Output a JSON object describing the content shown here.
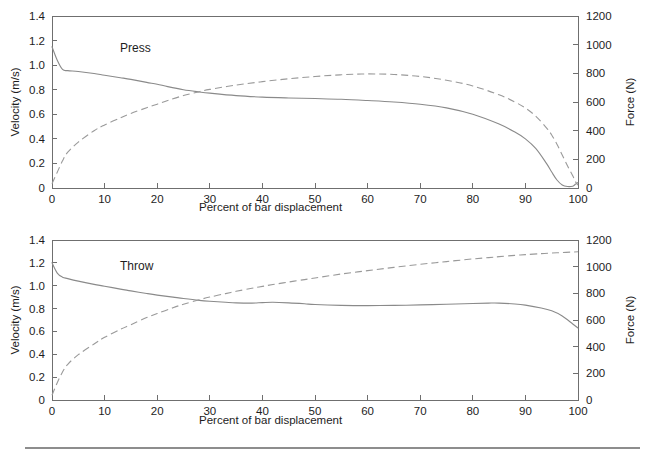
{
  "figure": {
    "background_color": "#ffffff",
    "line_color_solid": "#8a8a8a",
    "line_color_dashed": "#9a9a9a",
    "axis_color": "#6f6f6f",
    "footer_rule": true
  },
  "chart_data": [
    {
      "type": "line",
      "title": "Press",
      "panel": "top",
      "xlabel": "Percent of bar displacement",
      "ylabel": "Velocity (m/s)",
      "y2label": "Force (N)",
      "xlim": [
        0,
        100
      ],
      "ylim": [
        0,
        1.4
      ],
      "y2lim": [
        0,
        1200
      ],
      "xticks": [
        0,
        10,
        20,
        30,
        40,
        50,
        60,
        70,
        80,
        90,
        100
      ],
      "yticks": [
        0,
        0.2,
        0.4,
        0.6,
        0.8,
        1.0,
        1.2,
        1.4
      ],
      "y2ticks": [
        0,
        200,
        400,
        600,
        800,
        1000,
        1200
      ],
      "xticklabels": [
        "0",
        "10",
        "20",
        "30",
        "40",
        "50",
        "60",
        "70",
        "80",
        "90",
        "100"
      ],
      "yticklabels": [
        "0",
        "0.2",
        "0.4",
        "0.6",
        "0.8",
        "1.0",
        "1.2",
        "1.4"
      ],
      "y2ticklabels": [
        "0",
        "200",
        "400",
        "600",
        "800",
        "1000",
        "1200"
      ],
      "grid": false,
      "legend": null,
      "x": [
        0,
        1,
        2,
        3,
        5,
        8,
        10,
        13,
        15,
        18,
        20,
        22,
        25,
        28,
        30,
        35,
        40,
        45,
        50,
        55,
        60,
        65,
        70,
        75,
        80,
        85,
        88,
        90,
        92,
        94,
        95,
        96,
        97,
        98,
        99,
        99.5,
        100
      ],
      "series": [
        {
          "name": "Velocity (m/s)",
          "axis": "left",
          "style": "solid",
          "values": [
            1.15,
            1.04,
            0.965,
            0.955,
            0.948,
            0.932,
            0.918,
            0.898,
            0.884,
            0.86,
            0.845,
            0.825,
            0.8,
            0.782,
            0.772,
            0.752,
            0.74,
            0.733,
            0.728,
            0.722,
            0.712,
            0.7,
            0.682,
            0.652,
            0.6,
            0.52,
            0.455,
            0.4,
            0.32,
            0.2,
            0.13,
            0.065,
            0.025,
            0.012,
            0.015,
            0.03,
            0.045
          ]
        },
        {
          "name": "Force (N)",
          "axis": "right",
          "style": "dashed",
          "values": [
            30,
            110,
            190,
            250,
            320,
            400,
            440,
            490,
            520,
            560,
            585,
            610,
            645,
            672,
            688,
            718,
            742,
            762,
            778,
            790,
            796,
            792,
            778,
            752,
            712,
            650,
            600,
            558,
            500,
            420,
            370,
            305,
            230,
            155,
            85,
            45,
            20
          ]
        }
      ]
    },
    {
      "type": "line",
      "title": "Throw",
      "panel": "bottom",
      "xlabel": "Percent of bar displacement",
      "ylabel": "Velocity (m/s)",
      "y2label": "Force (N)",
      "xlim": [
        0,
        100
      ],
      "ylim": [
        0,
        1.4
      ],
      "y2lim": [
        0,
        1200
      ],
      "xticks": [
        0,
        10,
        20,
        30,
        40,
        50,
        60,
        70,
        80,
        90,
        100
      ],
      "yticks": [
        0,
        0.2,
        0.4,
        0.6,
        0.8,
        1.0,
        1.2,
        1.4
      ],
      "y2ticks": [
        0,
        200,
        400,
        600,
        800,
        1000,
        1200
      ],
      "xticklabels": [
        "0",
        "10",
        "20",
        "30",
        "40",
        "50",
        "60",
        "70",
        "80",
        "90",
        "100"
      ],
      "yticklabels": [
        "0",
        "0.2",
        "0.4",
        "0.6",
        "0.8",
        "1.0",
        "1.2",
        "1.4"
      ],
      "y2ticklabels": [
        "0",
        "200",
        "400",
        "600",
        "800",
        "1000",
        "1200"
      ],
      "grid": false,
      "legend": null,
      "x": [
        0,
        1,
        2,
        3,
        5,
        8,
        10,
        13,
        15,
        18,
        20,
        23,
        25,
        28,
        30,
        33,
        35,
        38,
        40,
        42,
        45,
        48,
        50,
        55,
        60,
        65,
        70,
        75,
        80,
        83,
        85,
        88,
        90,
        93,
        95,
        97,
        99,
        100
      ],
      "series": [
        {
          "name": "Velocity (m/s)",
          "axis": "left",
          "style": "solid",
          "values": [
            1.2,
            1.11,
            1.075,
            1.062,
            1.04,
            1.012,
            0.996,
            0.97,
            0.955,
            0.932,
            0.918,
            0.9,
            0.888,
            0.872,
            0.864,
            0.855,
            0.85,
            0.848,
            0.852,
            0.855,
            0.85,
            0.842,
            0.835,
            0.828,
            0.826,
            0.828,
            0.832,
            0.838,
            0.845,
            0.848,
            0.848,
            0.84,
            0.83,
            0.805,
            0.78,
            0.735,
            0.665,
            0.63
          ]
        },
        {
          "name": "Force (N)",
          "axis": "right",
          "style": "dashed",
          "values": [
            35,
            130,
            210,
            268,
            340,
            420,
            470,
            530,
            565,
            618,
            648,
            692,
            718,
            752,
            772,
            798,
            815,
            838,
            852,
            866,
            885,
            903,
            915,
            945,
            970,
            995,
            1018,
            1038,
            1058,
            1068,
            1075,
            1085,
            1090,
            1098,
            1102,
            1106,
            1110,
            1112
          ]
        }
      ]
    }
  ]
}
